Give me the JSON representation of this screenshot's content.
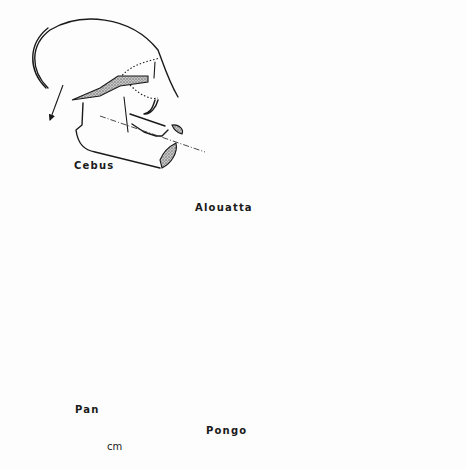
{
  "figure": {
    "type": "comparative anatomy line drawing",
    "specimens": [
      {
        "id": "cebus",
        "label": "Cebus"
      },
      {
        "id": "alouatta",
        "label": "Alouatta"
      },
      {
        "id": "pan",
        "label": "Pan"
      },
      {
        "id": "pongo",
        "label": "Pongo"
      }
    ],
    "scale_bar": {
      "unit": "cm",
      "divisions": 5
    },
    "colors": {
      "ink": "#1a1a1a",
      "paper": "#fdfdfd",
      "stipple": "#9a9a9a"
    }
  }
}
